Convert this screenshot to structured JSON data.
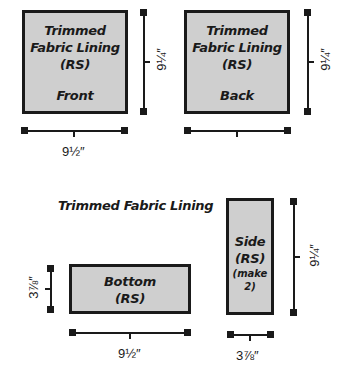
{
  "pieces": {
    "front": {
      "line1": "Trimmed",
      "line2": "Fabric Lining",
      "line3": "(RS)",
      "line4": "Front",
      "width": "9½″",
      "height": "9¼″"
    },
    "back": {
      "line1": "Trimmed",
      "line2": "Fabric Lining",
      "line3": "(RS)",
      "line4": "Back",
      "width": "9½″",
      "height": "9¼″"
    },
    "group_title": "Trimmed Fabric Lining",
    "bottom": {
      "line1": "Bottom",
      "line2": "(RS)",
      "width": "9½″",
      "height": "3⅞″"
    },
    "side": {
      "line1": "Side",
      "line2": "(RS)",
      "line3": "(make 2)",
      "width": "3⅞″",
      "height": "9¼″"
    }
  },
  "colors": {
    "fill": "#cfcfcf",
    "stroke": "#1a1a1a"
  }
}
